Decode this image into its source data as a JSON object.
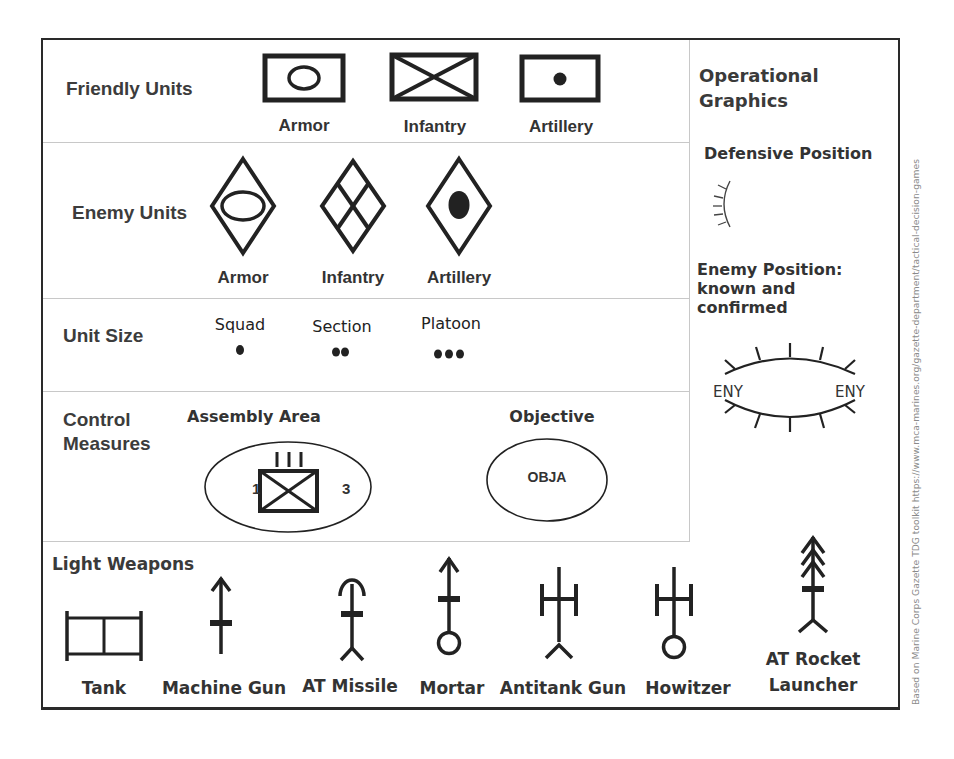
{
  "friendly_units": {
    "label": "Friendly Units",
    "symbols": [
      {
        "name": "Armor",
        "icon": "friendly-armor-icon"
      },
      {
        "name": "Infantry",
        "icon": "friendly-infantry-icon"
      },
      {
        "name": "Artillery",
        "icon": "friendly-artillery-icon"
      }
    ]
  },
  "enemy_units": {
    "label": "Enemy Units",
    "symbols": [
      {
        "name": "Armor",
        "icon": "enemy-armor-icon"
      },
      {
        "name": "Infantry",
        "icon": "enemy-infantry-icon"
      },
      {
        "name": "Artillery",
        "icon": "enemy-artillery-icon"
      }
    ]
  },
  "unit_size": {
    "label": "Unit Size",
    "sizes": [
      {
        "name": "Squad",
        "dots": 1
      },
      {
        "name": "Section",
        "dots": 2
      },
      {
        "name": "Platoon",
        "dots": 3
      }
    ]
  },
  "control_measures": {
    "label_line1": "Control",
    "label_line2": "Measures",
    "assembly_area": {
      "title": "Assembly Area",
      "echelon": "III",
      "left_number": "1",
      "right_number": "3"
    },
    "objective": {
      "title": "Objective",
      "text": "OBJA"
    }
  },
  "operational_graphics": {
    "title_line1": "Operational",
    "title_line2": "Graphics",
    "defensive_position": "Defensive Position",
    "enemy_position_line1": "Enemy Position:",
    "enemy_position_line2": "known and",
    "enemy_position_line3": "confirmed",
    "eny_left": "ENY",
    "eny_right": "ENY"
  },
  "light_weapons": {
    "label": "Light Weapons",
    "items": [
      {
        "name": "Tank",
        "icon": "tank-icon"
      },
      {
        "name": "Machine Gun",
        "icon": "machine-gun-icon"
      },
      {
        "name": "AT Missile",
        "icon": "at-missile-icon"
      },
      {
        "name": "Mortar",
        "icon": "mortar-icon"
      },
      {
        "name": "Antitank Gun",
        "icon": "antitank-gun-icon"
      },
      {
        "name": "Howitzer",
        "icon": "howitzer-icon"
      },
      {
        "name": "AT Rocket",
        "name_line2": "Launcher",
        "icon": "at-rocket-launcher-icon"
      }
    ]
  },
  "credit": "Based on Marine Corps Gazette  TDG toolkit https://www.mca-marines.org/gazette-department/tactical-decision-games"
}
